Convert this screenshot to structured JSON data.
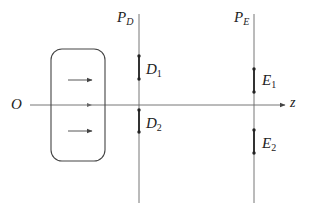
{
  "diagram": {
    "origin_label": "O",
    "axis_label": "z",
    "planes": [
      {
        "id": "PD",
        "label_main": "P",
        "label_sub": "D",
        "x": 139
      },
      {
        "id": "PE",
        "label_main": "P",
        "label_sub": "E",
        "x": 254
      }
    ],
    "segments": [
      {
        "id": "D1",
        "label_main": "D",
        "label_sub": "1",
        "plane": "PD",
        "y1": 56,
        "y2": 79
      },
      {
        "id": "D2",
        "label_main": "D",
        "label_sub": "2",
        "plane": "PD",
        "y1": 110,
        "y2": 132
      },
      {
        "id": "E1",
        "label_main": "E",
        "label_sub": "1",
        "plane": "PE",
        "y1": 69,
        "y2": 92
      },
      {
        "id": "E2",
        "label_main": "E",
        "label_sub": "2",
        "plane": "PE",
        "y1": 130,
        "y2": 153
      }
    ],
    "source_box": {
      "x": 51,
      "y": 49,
      "width": 54,
      "height": 112,
      "arrows": 3
    },
    "colors": {
      "line": "#555555",
      "segment": "#333333",
      "text": "#222222",
      "background": "#ffffff"
    }
  }
}
